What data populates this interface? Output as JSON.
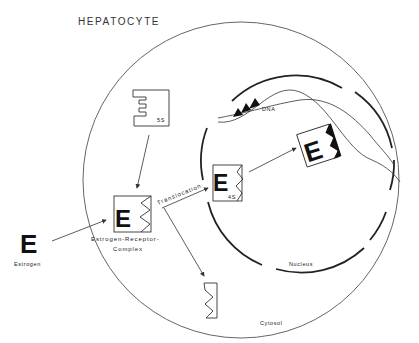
{
  "figure": {
    "title": "HEPATOCYTE",
    "regions": {
      "cytosol": "Cytosol",
      "nucleus": "Nucleus"
    },
    "molecules": {
      "estrogen": {
        "glyph": "E",
        "label": "Estrogen"
      },
      "receptor_5s": {
        "label": "5S"
      },
      "complex": {
        "glyph": "E",
        "label_line1": "Estrogen-Receptor-",
        "label_line2": "Complex"
      },
      "receptor_4s": {
        "glyph": "E",
        "label": "4S"
      },
      "bound_complex": {
        "glyph": "E"
      },
      "dna": {
        "label": "DNA"
      },
      "free_receptor": {
        "label": ""
      }
    },
    "process": {
      "translocation": "Translocation"
    },
    "colors": {
      "line": "#333333",
      "ink": "#111111",
      "background": "#ffffff"
    }
  }
}
